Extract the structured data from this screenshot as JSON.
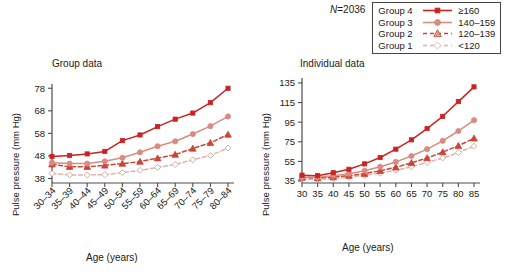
{
  "legend": {
    "n_prefix": "N",
    "n_value": "=2036",
    "n_text": "N=2036",
    "rows": [
      {
        "name": "Group 4",
        "value": "≥160",
        "marker": "square",
        "color": "#cc2222",
        "dash": "solid",
        "fill": "#cc2222"
      },
      {
        "name": "Group 3",
        "value": "140–159",
        "marker": "circle",
        "color": "#d98a82",
        "dash": "solid",
        "fill": "#d98a82"
      },
      {
        "name": "Group 2",
        "value": "120–139",
        "marker": "triangle",
        "color": "#cc4436",
        "dash": "dashed",
        "fill": "#dd9c93"
      },
      {
        "name": "Group 1",
        "value": "<120",
        "marker": "diamond",
        "color": "#e3b2aa",
        "dash": "dashed",
        "fill": "#ffffff"
      }
    ]
  },
  "panels": [
    {
      "id": "group",
      "title": "Group data",
      "ylabel": "Pulse pressure (mm Hg)",
      "xlabel": "Age (years)"
    },
    {
      "id": "individual",
      "title": "Individual data",
      "ylabel": "Pulse pressure (mm Hg)",
      "xlabel": "Age (years)"
    }
  ],
  "chart_data": [
    {
      "type": "line",
      "id": "group-data",
      "title": "Group data",
      "xlabel": "Age (years)",
      "ylabel": "Pulse pressure (mm Hg)",
      "categories": [
        "30–34",
        "35–39",
        "40–44",
        "45–49",
        "50–54",
        "55–59",
        "60–64",
        "65–69",
        "70–74",
        "75–79",
        "80–84"
      ],
      "yticks": [
        38,
        48,
        58,
        68,
        78
      ],
      "ylim": [
        36,
        79
      ],
      "xtick_rotation": -45,
      "grid": false,
      "legend_position": "top-right-external",
      "series": [
        {
          "name": "Group 4",
          "label": "≥160",
          "color": "#cc2222",
          "marker": "square",
          "dash": "solid",
          "values": [
            47.8,
            48.2,
            48.9,
            50.0,
            54.8,
            57.3,
            61.0,
            64.3,
            67.0,
            71.6,
            78.0,
            77.2
          ]
        },
        {
          "name": "Group 3",
          "label": "140–159",
          "color": "#d98a82",
          "marker": "circle",
          "dash": "solid",
          "values": [
            45.0,
            44.6,
            44.6,
            45.6,
            47.2,
            49.6,
            52.3,
            54.5,
            57.7,
            61.2,
            65.5,
            67.0
          ]
        },
        {
          "name": "Group 2",
          "label": "120–139",
          "color": "#cc4436",
          "marker": "triangle",
          "dash": "dashed",
          "values": [
            44.3,
            43.2,
            43.2,
            43.8,
            44.6,
            45.5,
            47.0,
            48.6,
            51.3,
            53.8,
            57.5,
            59.0
          ]
        },
        {
          "name": "Group 1",
          "label": "<120",
          "color": "#e3b2aa",
          "marker": "diamond",
          "dash": "dashed",
          "values": [
            40.2,
            39.6,
            39.6,
            39.7,
            40.6,
            41.6,
            42.9,
            44.2,
            46.3,
            48.2,
            51.5,
            54.0
          ]
        }
      ]
    },
    {
      "type": "line",
      "id": "individual-data",
      "title": "Individual data",
      "xlabel": "Age (years)",
      "ylabel": "Pulse pressure (mm Hg)",
      "x": [
        30,
        35,
        40,
        45,
        50,
        55,
        60,
        65,
        70,
        75,
        80,
        85
      ],
      "xticks": [
        30,
        35,
        40,
        45,
        50,
        55,
        60,
        65,
        70,
        75,
        80,
        85
      ],
      "yticks": [
        35,
        55,
        75,
        95,
        115,
        135
      ],
      "ylim": [
        33,
        138
      ],
      "grid": false,
      "legend_position": "top-right-external",
      "series": [
        {
          "name": "Group 4",
          "label": "≥160",
          "color": "#cc2222",
          "marker": "square",
          "dash": "solid",
          "values": [
            41.0,
            40.5,
            43.5,
            47.0,
            52.5,
            59.0,
            67.5,
            77.0,
            88.5,
            101.0,
            116.0,
            131.0
          ]
        },
        {
          "name": "Group 3",
          "label": "140–159",
          "color": "#d98a82",
          "marker": "circle",
          "dash": "solid",
          "values": [
            39.0,
            38.8,
            40.5,
            42.5,
            45.5,
            49.5,
            54.5,
            60.5,
            67.5,
            76.0,
            86.0,
            97.0
          ]
        },
        {
          "name": "Group 2",
          "label": "120–139",
          "color": "#cc4436",
          "marker": "triangle",
          "dash": "dashed",
          "values": [
            38.5,
            38.0,
            39.0,
            40.5,
            42.5,
            45.5,
            49.0,
            53.5,
            58.5,
            64.5,
            71.0,
            78.5
          ]
        },
        {
          "name": "Group 1",
          "label": "<120",
          "color": "#e3b2aa",
          "marker": "diamond",
          "dash": "dashed",
          "values": [
            37.0,
            36.8,
            37.5,
            38.8,
            40.8,
            43.0,
            46.0,
            49.5,
            54.0,
            58.5,
            64.0,
            70.5
          ]
        }
      ]
    }
  ]
}
